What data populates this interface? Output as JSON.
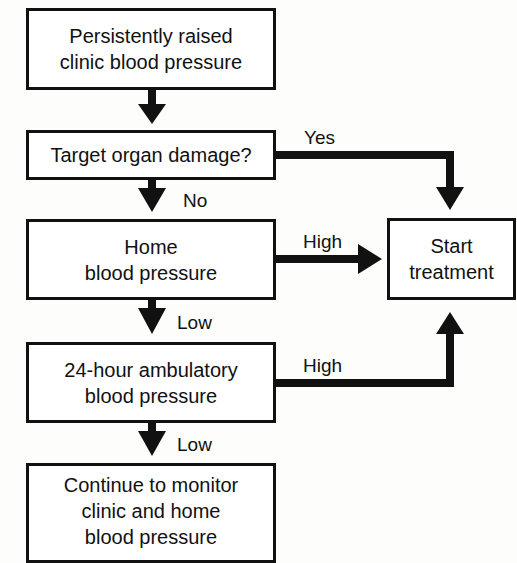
{
  "diagram": {
    "type": "flowchart",
    "nodes": [
      {
        "id": "start",
        "lines": [
          "Persistently raised",
          "clinic blood pressure"
        ]
      },
      {
        "id": "tod",
        "lines": [
          "Target organ damage?"
        ]
      },
      {
        "id": "home",
        "lines": [
          "Home",
          "blood pressure"
        ]
      },
      {
        "id": "abpm",
        "lines": [
          "24-hour ambulatory",
          "blood pressure"
        ]
      },
      {
        "id": "monitor",
        "lines": [
          "Continue to monitor",
          "clinic and home",
          "blood pressure"
        ]
      },
      {
        "id": "treat",
        "lines": [
          "Start",
          "treatment"
        ]
      }
    ],
    "edges": [
      {
        "from": "start",
        "to": "tod",
        "label": ""
      },
      {
        "from": "tod",
        "to": "treat",
        "label": "Yes"
      },
      {
        "from": "tod",
        "to": "home",
        "label": "No"
      },
      {
        "from": "home",
        "to": "treat",
        "label": "High"
      },
      {
        "from": "home",
        "to": "abpm",
        "label": "Low"
      },
      {
        "from": "abpm",
        "to": "treat",
        "label": "High"
      },
      {
        "from": "abpm",
        "to": "monitor",
        "label": "Low"
      }
    ]
  }
}
